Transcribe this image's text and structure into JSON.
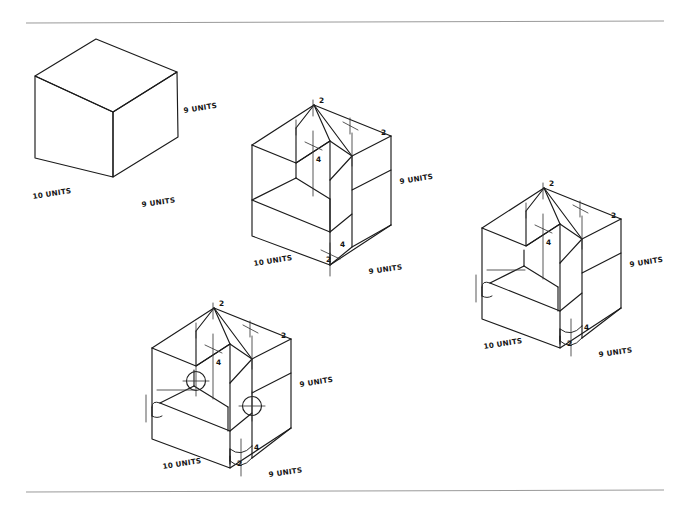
{
  "sheet": {
    "title": "Isometric construction sketches - block with notch, step, fillet and holes",
    "background_color": "#ffffff",
    "ink_color": "#1b1b1b",
    "rule_color": "#9a9a9a",
    "width": 688,
    "height": 506,
    "rules": [
      {
        "name": "top-rule",
        "x1": 26,
        "y1": 23,
        "x2": 664,
        "y2": 21
      },
      {
        "name": "bottom-rule",
        "x1": 26,
        "y1": 492,
        "x2": 664,
        "y2": 490
      }
    ]
  },
  "figures": [
    {
      "id": "figure-1",
      "name": "plain-cube",
      "description": "Plain isometric cube, no cuts",
      "labels": {
        "left_depth": "10 UNITS",
        "right_width": "9 UNITS",
        "vertical_height": "9 UNITS"
      },
      "dimensions": [],
      "features": []
    },
    {
      "id": "figure-2",
      "name": "block-with-notch-and-step",
      "description": "Cube with V-notch cut in top face and rectangular step cut at lower front",
      "labels": {
        "left_depth": "10 UNITS",
        "right_width": "9 UNITS",
        "vertical_height": "9 UNITS"
      },
      "dimensions": [
        {
          "name": "notch-top-left-width",
          "value": "2"
        },
        {
          "name": "notch-top-right-width",
          "value": "2"
        },
        {
          "name": "notch-depth",
          "value": "4"
        },
        {
          "name": "step-height",
          "value": "4"
        },
        {
          "name": "step-depth",
          "value": "2"
        }
      ],
      "features": [
        "v-notch",
        "lower-step"
      ]
    },
    {
      "id": "figure-3",
      "name": "block-with-notch-step-and-fillets",
      "description": "Same block with rounded fillet corners added to the lower step",
      "labels": {
        "left_depth": "10 UNITS",
        "right_width": "9 UNITS",
        "vertical_height": "9 UNITS"
      },
      "dimensions": [
        {
          "name": "notch-top-left-width",
          "value": "2"
        },
        {
          "name": "notch-top-right-width",
          "value": "2"
        },
        {
          "name": "notch-depth",
          "value": "4"
        },
        {
          "name": "step-height",
          "value": "4"
        },
        {
          "name": "step-depth",
          "value": "2"
        }
      ],
      "features": [
        "v-notch",
        "lower-step",
        "rounded-fillets"
      ]
    },
    {
      "id": "figure-4",
      "name": "block-with-notch-step-fillets-and-holes",
      "description": "Final block with two circular holes added on the notch walls",
      "labels": {
        "left_depth": "10 UNITS",
        "right_width": "9 UNITS",
        "vertical_height": "9 UNITS"
      },
      "dimensions": [
        {
          "name": "notch-top-left-width",
          "value": "2"
        },
        {
          "name": "notch-top-right-width",
          "value": "2"
        },
        {
          "name": "notch-depth",
          "value": "4"
        },
        {
          "name": "step-height",
          "value": "4"
        },
        {
          "name": "step-depth",
          "value": "2"
        }
      ],
      "features": [
        "v-notch",
        "lower-step",
        "rounded-fillets",
        "two-circular-holes"
      ]
    }
  ]
}
